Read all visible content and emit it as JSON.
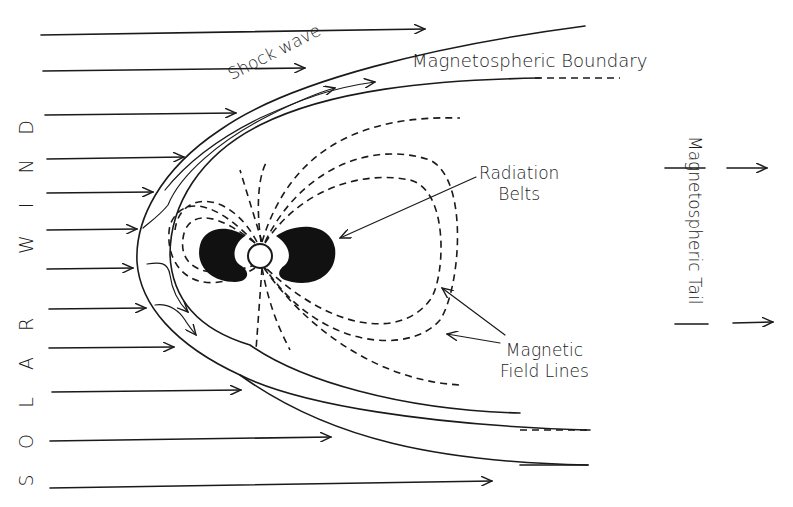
{
  "diagram": {
    "labels": {
      "shock_wave": "Shock wave",
      "magnetospheric_boundary": "Magnetospheric Boundary",
      "radiation_belts_line1": "Radiation",
      "radiation_belts_line2": "Belts",
      "magnetic_field_lines_line1": "Magnetic",
      "magnetic_field_lines_line2": "Field Lines",
      "magnetospheric_tail": "Magnetospheric Tail",
      "solar_wind_letters": [
        "D",
        "N",
        "I",
        "W",
        "R",
        "A",
        "L",
        "O",
        "S"
      ]
    },
    "elements": [
      "solar-wind-arrows",
      "shock-wave-curve",
      "magnetospheric-boundary-curve",
      "earth",
      "radiation-belts",
      "magnetic-field-lines",
      "tail-arrows"
    ],
    "colors": {
      "ink": "#1a1a1a",
      "background": "#ffffff"
    }
  }
}
